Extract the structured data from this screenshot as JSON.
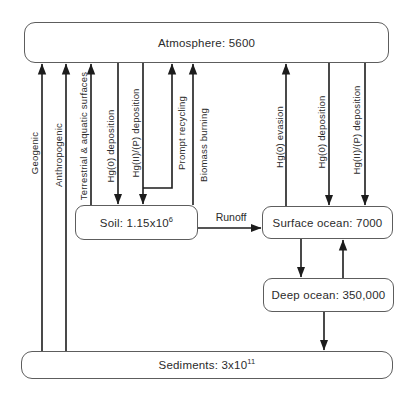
{
  "boxes": {
    "atmosphere": {
      "label": "Atmosphere: 5600"
    },
    "soil": {
      "base": "Soil: 1.15x10",
      "exp": "6"
    },
    "surface_ocean": {
      "label": "Surface ocean: 7000"
    },
    "deep_ocean": {
      "label": "Deep ocean: 350,000"
    },
    "sediments": {
      "base": "Sediments: 3x10",
      "exp": "11"
    }
  },
  "flows": {
    "geogenic": {
      "label": "Geogenic",
      "from": "Sediments",
      "to": "Atmosphere"
    },
    "anthropogenic": {
      "label": "Anthropogenic",
      "from": "Sediments",
      "to": "Atmosphere"
    },
    "terrestrial_aquatic": {
      "label": "Terrestrial & aquatic surfaces",
      "from": "Soil",
      "to": "Atmosphere"
    },
    "hg0_deposition_land": {
      "label": "Hg(0) deposition",
      "from": "Atmosphere",
      "to": "Soil"
    },
    "hg2_deposition_land": {
      "label": "Hg(II)/(P) deposition",
      "from": "Atmosphere",
      "to": "Soil"
    },
    "prompt_recycling": {
      "label": "Prompt recycling",
      "from": "Soil",
      "to": "Atmosphere"
    },
    "biomass_burning": {
      "label": "Biomass burning",
      "from": "Soil",
      "to": "Atmosphere"
    },
    "hg0_evasion": {
      "label": "Hg(0) evasion",
      "from": "Surface ocean",
      "to": "Atmosphere"
    },
    "hg0_deposition_ocean": {
      "label": "Hg(0) deposition",
      "from": "Atmosphere",
      "to": "Surface ocean"
    },
    "hg2_deposition_ocean": {
      "label": "Hg(II)/(P) deposition",
      "from": "Atmosphere",
      "to": "Surface ocean"
    },
    "runoff": {
      "label": "Runoff",
      "from": "Soil",
      "to": "Surface ocean"
    },
    "surface_to_deep": {
      "label": "",
      "from": "Surface ocean",
      "to": "Deep ocean"
    },
    "deep_to_surface": {
      "label": "",
      "from": "Deep ocean",
      "to": "Surface ocean"
    },
    "deep_to_sediments": {
      "label": "",
      "from": "Deep ocean",
      "to": "Sediments"
    }
  },
  "colors": {
    "line": "#1c1c1c",
    "box_border": "#5d5d5d",
    "text": "#2b2b2b",
    "background": "#ffffff"
  }
}
